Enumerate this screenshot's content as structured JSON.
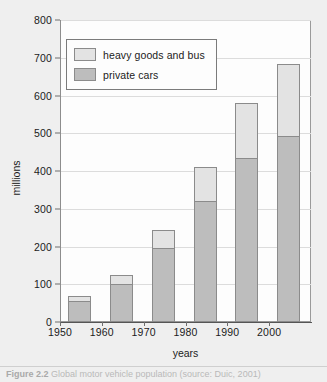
{
  "figure": {
    "caption_label": "Figure 2.2",
    "caption_text": "Global motor vehicle population (source: Duic, 2001)"
  },
  "legend": {
    "position": "top-left-inside",
    "items": [
      {
        "label": "heavy goods and bus",
        "color": "#e3e3e3",
        "swatch_name": "legend-swatch-heavy-goods"
      },
      {
        "label": "private cars",
        "color": "#bdbdbd",
        "swatch_name": "legend-swatch-private-cars"
      }
    ]
  },
  "chart_data": {
    "type": "bar",
    "subtype": "stacked",
    "title": "",
    "xlabel": "years",
    "ylabel": "millions",
    "categories": [
      "1950",
      "1960",
      "1970",
      "1980",
      "1990",
      "2000"
    ],
    "series": [
      {
        "name": "private cars",
        "color": "#bdbdbd",
        "values": [
          55,
          100,
          195,
          320,
          435,
          492
        ]
      },
      {
        "name": "heavy goods and bus",
        "color": "#e3e3e3",
        "values": [
          15,
          25,
          50,
          90,
          145,
          191
        ]
      }
    ],
    "totals": [
      70,
      125,
      245,
      410,
      580,
      683
    ],
    "ylim": [
      0,
      800
    ],
    "ytick_values": [
      0,
      100,
      200,
      300,
      400,
      500,
      600,
      700,
      800
    ],
    "ytick_labels": [
      "0",
      "100",
      "200",
      "300",
      "400",
      "500",
      "600",
      "700",
      "800"
    ],
    "xtick_labels": [
      "1950",
      "1960",
      "1970",
      "1980",
      "1990",
      "2000"
    ],
    "grid": "horizontal",
    "legend_position": "upper left"
  },
  "colors": {
    "page_background": "#efefef",
    "plot_background": "#fdfdfd",
    "gridline": "#dcdcdc",
    "axis": "#6f6f6f",
    "bar_border": "#8b8b8b",
    "text": "#1b1b1b"
  }
}
